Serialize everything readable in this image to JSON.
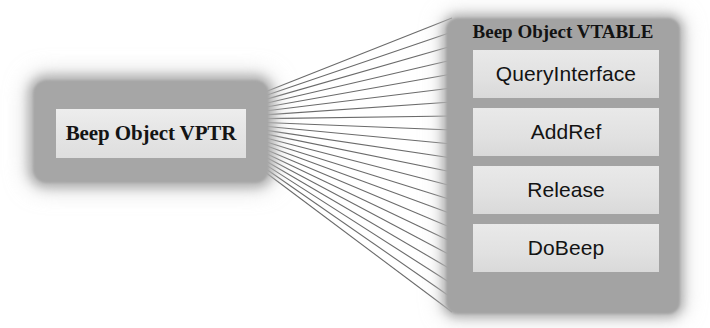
{
  "diagram": {
    "type": "vptr-vtable-pointer-diagram",
    "background_color": "#ffffff",
    "connector_color": "#6b6b6b"
  },
  "vptr": {
    "label": "Beep Object VPTR",
    "plate_color": "#a6a6a6",
    "inner_color": "#e8e8e8"
  },
  "vtable": {
    "title": "Beep Object VTABLE",
    "plate_color": "#a3a3a3",
    "slot_color": "#e3e3e3",
    "slots": [
      {
        "label": "QueryInterface"
      },
      {
        "label": "AddRef"
      },
      {
        "label": "Release"
      },
      {
        "label": "DoBeep"
      }
    ]
  },
  "connectors": {
    "count": 22,
    "origin_x": 265,
    "origin_top_y": 92,
    "origin_bottom_y": 172,
    "target_x": 452,
    "target_top_y": 18,
    "target_bottom_y": 312
  }
}
